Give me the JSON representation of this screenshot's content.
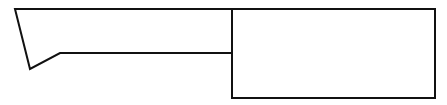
{
  "diagram": {
    "width": 447,
    "height": 105,
    "background": "#ffffff",
    "stroke": "#111111",
    "stroke_width": 2,
    "shapes": [
      {
        "name": "blade",
        "type": "polyline",
        "points": [
          [
            232,
            9
          ],
          [
            15,
            9
          ],
          [
            30,
            69
          ],
          [
            60,
            53
          ],
          [
            232,
            53
          ]
        ]
      },
      {
        "name": "handle",
        "type": "rect",
        "x": 232,
        "y": 9,
        "width": 203,
        "height": 89
      }
    ]
  }
}
